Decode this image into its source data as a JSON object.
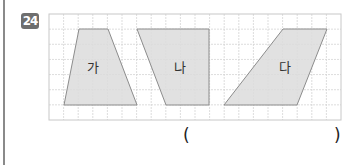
{
  "question": {
    "number": "24",
    "answer_open": "(",
    "answer_close": ")"
  },
  "figure": {
    "grid": {
      "x": 49,
      "y": 14,
      "width": 292,
      "height": 106,
      "cols": 20,
      "rows": 7,
      "color": "#d4d4d4",
      "border": "#c8c8c8"
    },
    "shapes": [
      {
        "label": "가",
        "points": "79,29 108,29 137,105 64,105",
        "label_x": 93,
        "label_y": 72
      },
      {
        "label": "나",
        "points": "137,29 209,29 209,105 166,105",
        "label_x": 180,
        "label_y": 72
      },
      {
        "label": "다",
        "points": "283,29 327,29 297,105 224,105",
        "label_x": 285,
        "label_y": 72
      }
    ],
    "fill": "#dcdcdc",
    "stroke": "#8c8c8c"
  }
}
